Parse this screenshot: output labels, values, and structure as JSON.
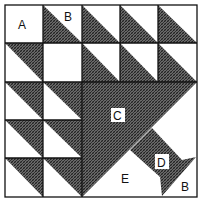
{
  "diagram": {
    "type": "quilt-block",
    "grid": {
      "rows": 5,
      "cols": 5
    },
    "colors": {
      "dark": "#555555",
      "light": "#ffffff",
      "line": "#111111"
    },
    "labels": {
      "a": "A",
      "b_top": "B",
      "c": "C",
      "d": "D",
      "e": "E",
      "b_bottom": "B"
    },
    "pieces": [
      {
        "label": "A",
        "shape": "square",
        "fill": "light"
      },
      {
        "label": "B",
        "shape": "half-square triangle",
        "fill": "dark/light"
      },
      {
        "label": "C",
        "shape": "large triangle",
        "fill": "dark"
      },
      {
        "label": "D",
        "shape": "handle strip",
        "fill": "dark"
      },
      {
        "label": "E",
        "shape": "triangle",
        "fill": "light"
      }
    ]
  }
}
